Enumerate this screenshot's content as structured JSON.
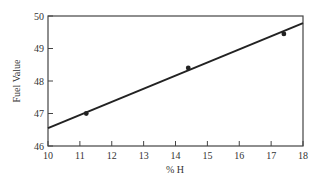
{
  "chart_data": {
    "type": "scatter",
    "title": "",
    "xlabel": "% H",
    "ylabel": "Fuel Value",
    "xlim": [
      10,
      18
    ],
    "ylim": [
      46,
      50
    ],
    "x_ticks": [
      10,
      11,
      12,
      13,
      14,
      15,
      16,
      17,
      18
    ],
    "y_ticks": [
      46,
      47,
      48,
      49,
      50
    ],
    "grid": false,
    "legend": null,
    "series": [
      {
        "name": "data",
        "kind": "scatter",
        "points": [
          {
            "x": 11.2,
            "y": 47.0
          },
          {
            "x": 14.4,
            "y": 48.4
          },
          {
            "x": 17.4,
            "y": 49.45
          }
        ]
      },
      {
        "name": "fit",
        "kind": "line",
        "points": [
          {
            "x": 10,
            "y": 46.55
          },
          {
            "x": 18,
            "y": 49.78
          }
        ]
      }
    ],
    "colors": {
      "frame": "#444444",
      "line": "#222222",
      "marker": "#222222",
      "text": "#333333"
    }
  }
}
